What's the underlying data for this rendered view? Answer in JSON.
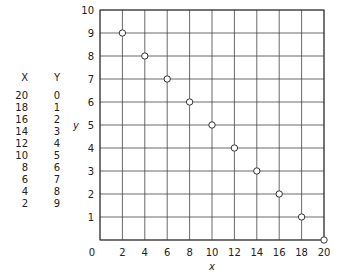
{
  "chart_data": {
    "type": "scatter",
    "title": "",
    "xlabel": "x",
    "ylabel": "y",
    "xlim": [
      0,
      20
    ],
    "ylim": [
      0,
      10
    ],
    "grid": true,
    "x_ticks": [
      0,
      2,
      4,
      6,
      8,
      10,
      12,
      14,
      16,
      18,
      20
    ],
    "y_ticks": [
      0,
      1,
      2,
      3,
      4,
      5,
      6,
      7,
      8,
      9,
      10
    ],
    "marker": "open-circle",
    "series": [
      {
        "name": "data",
        "x": [
          20,
          18,
          16,
          14,
          12,
          10,
          8,
          6,
          4,
          2
        ],
        "y": [
          0,
          1,
          2,
          3,
          4,
          5,
          6,
          7,
          8,
          9
        ]
      }
    ]
  },
  "table": {
    "headers": [
      "X",
      "Y"
    ],
    "rows": [
      [
        "20",
        "0"
      ],
      [
        "18",
        "1"
      ],
      [
        "16",
        "2"
      ],
      [
        "14",
        "3"
      ],
      [
        "12",
        "4"
      ],
      [
        "10",
        "5"
      ],
      [
        "8",
        "6"
      ],
      [
        "6",
        "7"
      ],
      [
        "4",
        "8"
      ],
      [
        "2",
        "9"
      ]
    ]
  },
  "colors": {
    "line": "#333333",
    "grid": "#444444",
    "text": "#222222"
  }
}
